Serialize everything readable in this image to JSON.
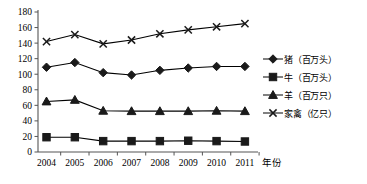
{
  "chart_data": {
    "type": "line",
    "title": "",
    "subtitle": "",
    "xlabel": "年份",
    "ylabel": "",
    "x": [
      "2004",
      "2005",
      "2006",
      "2007",
      "2008",
      "2009",
      "2010",
      "2011"
    ],
    "categories": [
      "2004",
      "2005",
      "2006",
      "2007",
      "2008",
      "2009",
      "2010",
      "2011"
    ],
    "ylim": [
      0,
      180
    ],
    "xlim_labels": [
      "2004",
      "2011"
    ],
    "yticks": [
      0,
      20,
      40,
      60,
      80,
      100,
      120,
      140,
      160,
      180
    ],
    "ytick_labels": [
      "0",
      "20",
      "40",
      "60",
      "80",
      "100",
      "120",
      "140",
      "160",
      "180"
    ],
    "grid": false,
    "legend_position": "right",
    "series": [
      {
        "name": "猪（百万头）",
        "marker": "diamond",
        "color": "#000000",
        "values": [
          109,
          115,
          102,
          99,
          105,
          108,
          110,
          110
        ]
      },
      {
        "name": "牛（百万头）",
        "marker": "square",
        "color": "#000000",
        "values": [
          19,
          19,
          14,
          14,
          14,
          14.5,
          14,
          13.5
        ]
      },
      {
        "name": "羊（百万只）",
        "marker": "triangle",
        "color": "#000000",
        "values": [
          65,
          67,
          53,
          52.5,
          52.5,
          52.5,
          53,
          52.5
        ]
      },
      {
        "name": "家禽（亿只）",
        "marker": "cross",
        "color": "#000000",
        "values": [
          142,
          151,
          139,
          144,
          152,
          157,
          161,
          165
        ]
      }
    ]
  },
  "axis": {
    "x_axis_label": "年份",
    "y_axis_label": ""
  },
  "legend": {
    "items": [
      {
        "label": "猪（百万头）",
        "marker": "diamond-marker"
      },
      {
        "label": "牛（百万头）",
        "marker": "square-marker"
      },
      {
        "label": "羊（百万只）",
        "marker": "triangle-marker"
      },
      {
        "label": "家禽（亿只）",
        "marker": "cross-marker"
      }
    ]
  },
  "colors": {
    "line": "#1a1a1a",
    "axis": "#555555",
    "text": "#000000",
    "background": "#ffffff"
  }
}
